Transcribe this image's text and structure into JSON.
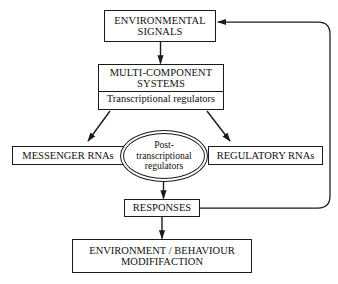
{
  "diagram": {
    "background_color": "#ffffff",
    "stroke_color": "#1a1a1a",
    "text_color": "#111111",
    "nodes": {
      "environmental_signals": {
        "line1": "ENVIRONMENTAL",
        "line2": "SIGNALS"
      },
      "multi_component_systems": {
        "line1": "MULTI-COMPONENT",
        "line2": "SYSTEMS",
        "subsection": "Transcriptional regulators"
      },
      "messenger_rnas": {
        "label": "MESSENGER RNAs"
      },
      "regulatory_rnas": {
        "label": "REGULATORY RNAs"
      },
      "post_transcriptional_regulators": {
        "line1": "Post-",
        "line2": "transcriptional",
        "line3": "regulators"
      },
      "responses": {
        "label": "RESPONSES"
      },
      "environment_behaviour": {
        "line1": "ENVIRONMENT / BEHAVIOUR",
        "line2": "MODIFIFACTION"
      }
    },
    "connectors": [
      {
        "name": "signals-to-systems",
        "from": "environmental_signals",
        "to": "multi_component_systems",
        "style": "straight-arrow"
      },
      {
        "name": "systems-to-messenger-rnas",
        "from": "multi_component_systems",
        "to": "messenger_rnas",
        "style": "diagonal-arrow"
      },
      {
        "name": "systems-to-regulatory-rnas",
        "from": "multi_component_systems",
        "to": "regulatory_rnas",
        "style": "diagonal-arrow"
      },
      {
        "name": "regulators-to-responses",
        "from": "post_transcriptional_regulators",
        "to": "responses",
        "style": "straight-arrow"
      },
      {
        "name": "responses-to-environment-behaviour",
        "from": "responses",
        "to": "environment_behaviour",
        "style": "straight-arrow"
      },
      {
        "name": "responses-feedback-to-signals",
        "from": "responses",
        "to": "environmental_signals",
        "style": "rounded-feedback-loop"
      }
    ]
  }
}
